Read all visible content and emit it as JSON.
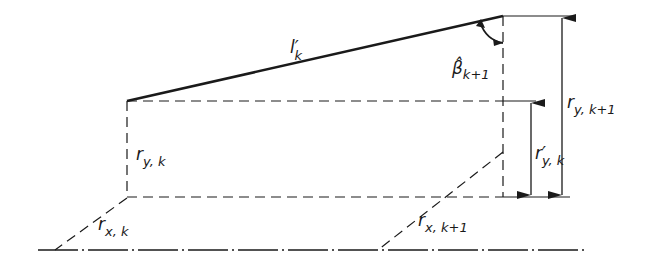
{
  "diagram": {
    "labels": {
      "l_k": {
        "main": "l",
        "prime": "′",
        "sub": "k"
      },
      "beta": {
        "main": "β̂",
        "sub": "k+1"
      },
      "r_y_k": {
        "main": "r",
        "sub": "y, k"
      },
      "r_y_k1": {
        "main": "r",
        "sub": "y, k+1"
      },
      "r_y_k_prime": {
        "main": "r",
        "prime": "′",
        "sub": "y, k"
      },
      "r_x_k": {
        "main": "r",
        "sub": "x, k"
      },
      "r_x_k1": {
        "main": "r",
        "sub": "x, k+1"
      }
    },
    "colors": {
      "line": "#1a1a1a",
      "background": "#ffffff"
    }
  }
}
